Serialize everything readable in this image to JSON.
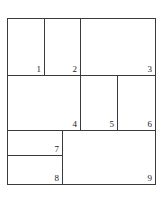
{
  "figure": {
    "title": "",
    "type": "rectangle-partition-diagram",
    "outline_color": "#3a3a3a",
    "background_color": "#ffffff",
    "label_color": "#222222",
    "cells": [
      {
        "id": "cell-1",
        "label": "1",
        "label_position": "bottom-right"
      },
      {
        "id": "cell-2",
        "label": "2",
        "label_position": "bottom-right"
      },
      {
        "id": "cell-3",
        "label": "3",
        "label_position": "bottom-right"
      },
      {
        "id": "cell-4",
        "label": "4",
        "label_position": "bottom-right"
      },
      {
        "id": "cell-5",
        "label": "5",
        "label_position": "bottom-right"
      },
      {
        "id": "cell-6",
        "label": "6",
        "label_position": "bottom-right"
      },
      {
        "id": "cell-7",
        "label": "7",
        "label_position": "bottom-right"
      },
      {
        "id": "cell-8",
        "label": "8",
        "label_position": "bottom-right"
      },
      {
        "id": "cell-9",
        "label": "9",
        "label_position": "bottom-right"
      }
    ]
  }
}
